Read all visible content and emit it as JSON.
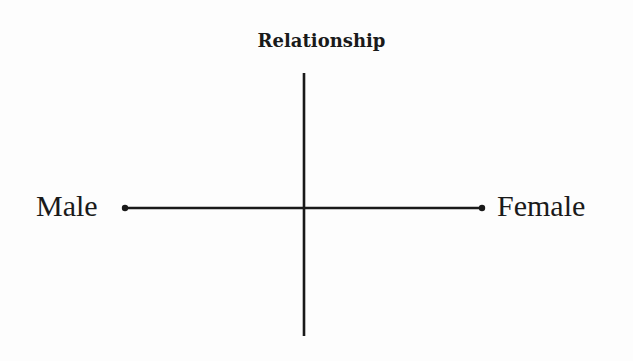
{
  "diagram": {
    "title": "Relationship",
    "horizontal_axis": {
      "left_label": "Male",
      "right_label": "Female",
      "left_endpoint": "dot",
      "right_endpoint": "dot"
    },
    "vertical_axis": {
      "top_label": "Relationship",
      "bottom_label": ""
    },
    "colors": {
      "line": "#1a1a1a",
      "text": "#1a1a1a",
      "background": "#fdfdfd"
    }
  }
}
